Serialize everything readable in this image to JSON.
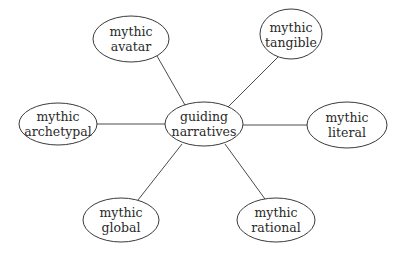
{
  "diagram": {
    "type": "hub-and-spoke",
    "center": {
      "id": "guiding",
      "lines": [
        "guiding",
        "narratives"
      ]
    },
    "nodes": [
      {
        "id": "avatar",
        "lines": [
          "mythic",
          "avatar"
        ]
      },
      {
        "id": "tangible",
        "lines": [
          "mythic",
          "tangible"
        ]
      },
      {
        "id": "archetypal",
        "lines": [
          "mythic",
          "archetypal"
        ]
      },
      {
        "id": "literal",
        "lines": [
          "mythic",
          "literal"
        ]
      },
      {
        "id": "global",
        "lines": [
          "mythic",
          "global"
        ]
      },
      {
        "id": "rational",
        "lines": [
          "mythic",
          "rational"
        ]
      }
    ],
    "edges": [
      {
        "from": "guiding",
        "to": "avatar"
      },
      {
        "from": "guiding",
        "to": "tangible"
      },
      {
        "from": "guiding",
        "to": "archetypal"
      },
      {
        "from": "guiding",
        "to": "literal"
      },
      {
        "from": "guiding",
        "to": "global"
      },
      {
        "from": "guiding",
        "to": "rational"
      }
    ]
  }
}
